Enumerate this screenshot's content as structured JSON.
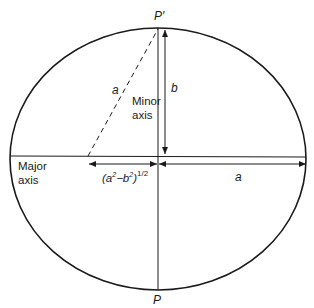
{
  "diagram": {
    "colors": {
      "stroke": "#1a1a1a",
      "background": "#ffffff"
    },
    "geometry": {
      "center": [
        158,
        156
      ],
      "semi_major_px": 148,
      "semi_minor_px": 131,
      "focus_x": 88
    },
    "labels": {
      "p_prime": "P′",
      "p": "P",
      "b": "b",
      "a_dashed": "a",
      "a_right": "a",
      "minor_axis_line1": "Minor",
      "minor_axis_line2": "axis",
      "major_axis_line1": "Major",
      "major_axis_line2": "axis",
      "focal_distance_base": "(a",
      "focal_distance_sup1": "2",
      "focal_distance_mid": "−b",
      "focal_distance_sup2": "2",
      "focal_distance_close": ")",
      "focal_distance_exp": "1/2"
    }
  }
}
